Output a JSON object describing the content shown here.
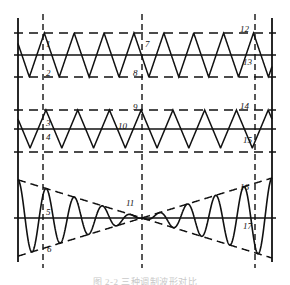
{
  "figure": {
    "caption": "图 2-2  三种调制波形对比",
    "width": 290,
    "height": 285,
    "background": "#ffffff",
    "stroke_color": "#111111"
  },
  "axes": {
    "left_axis_x": 18,
    "right_axis_x": 272,
    "top_y": 18,
    "bottom_y": 262,
    "axis_stroke_width": 1.6
  },
  "markers": {
    "label": "vertical dashed marker lines",
    "dash_pattern": "6,4",
    "stroke_width": 1.4,
    "lines": [
      {
        "name": "marker-line-left",
        "x": 43
      },
      {
        "name": "marker-line-center",
        "x": 142
      },
      {
        "name": "marker-line-right",
        "x": 255
      }
    ]
  },
  "panels": [
    {
      "name": "panel-top-triangle",
      "wave_type": "triangle",
      "center_y": 55,
      "amplitude": 22,
      "upper_guide_y": 33,
      "lower_guide_y": 77,
      "cycles": 8.5,
      "phase": 0.62,
      "guides": [
        {
          "name": "guide-upper-dashed",
          "y": 33,
          "style": "dashed"
        },
        {
          "name": "guide-center-solid",
          "y": 55,
          "style": "solid"
        },
        {
          "name": "guide-lower-dashed",
          "y": 77,
          "style": "dashed"
        }
      ]
    },
    {
      "name": "panel-middle-triangle",
      "wave_type": "triangle",
      "center_y": 129,
      "amplitude": 19,
      "upper_guide_y": 110,
      "lower_guide_y": 152,
      "cycles": 8,
      "phase": 0.62,
      "guides": [
        {
          "name": "guide-upper-dashed",
          "y": 110,
          "style": "dashed"
        },
        {
          "name": "guide-center-solid",
          "y": 129,
          "style": "solid"
        },
        {
          "name": "guide-lower-dashed",
          "y": 152,
          "style": "dashed"
        }
      ]
    },
    {
      "name": "panel-bottom-modulated",
      "wave_type": "amplitude-modulated-sine",
      "center_y": 218,
      "max_amplitude": 40,
      "cycles": 9,
      "envelope_crossing_x": 142,
      "guides": [
        {
          "name": "guide-center-solid",
          "y": 218,
          "style": "solid"
        }
      ],
      "envelope": {
        "name": "envelope-dashed-x-crossing",
        "style": "dashed",
        "description": "two dashed envelopes crossing at the center marker forming an X"
      }
    }
  ],
  "point_labels": [
    {
      "id": "1",
      "name": "point-label-1",
      "text": "1",
      "x": 46,
      "y": 40
    },
    {
      "id": "2",
      "name": "point-label-2",
      "text": "2",
      "x": 46,
      "y": 69
    },
    {
      "id": "3",
      "name": "point-label-3",
      "text": "3",
      "x": 46,
      "y": 119
    },
    {
      "id": "4",
      "name": "point-label-4",
      "text": "4",
      "x": 46,
      "y": 133
    },
    {
      "id": "5",
      "name": "point-label-5",
      "text": "5",
      "x": 46,
      "y": 208
    },
    {
      "id": "6",
      "name": "point-label-6",
      "text": "6",
      "x": 47,
      "y": 245
    },
    {
      "id": "7",
      "name": "point-label-7",
      "text": "7",
      "x": 145,
      "y": 40
    },
    {
      "id": "8",
      "name": "point-label-8",
      "text": "8",
      "x": 133,
      "y": 69
    },
    {
      "id": "9",
      "name": "point-label-9",
      "text": "9",
      "x": 133,
      "y": 103
    },
    {
      "id": "10",
      "name": "point-label-10",
      "text": "10",
      "x": 118,
      "y": 122
    },
    {
      "id": "11",
      "name": "point-label-11",
      "text": "11",
      "x": 126,
      "y": 199
    },
    {
      "id": "12",
      "name": "point-label-12",
      "text": "12",
      "x": 240,
      "y": 25
    },
    {
      "id": "13",
      "name": "point-label-13",
      "text": "13",
      "x": 243,
      "y": 58
    },
    {
      "id": "14",
      "name": "point-label-14",
      "text": "14",
      "x": 240,
      "y": 102
    },
    {
      "id": "15",
      "name": "point-label-15",
      "text": "15",
      "x": 243,
      "y": 136
    },
    {
      "id": "16",
      "name": "point-label-16",
      "text": "16",
      "x": 240,
      "y": 183
    },
    {
      "id": "17",
      "name": "point-label-17",
      "text": "17",
      "x": 243,
      "y": 222
    }
  ],
  "chart_data": {
    "type": "line",
    "xlabel": "",
    "ylabel": "",
    "grid": false,
    "legend": "none",
    "xlim": [
      18,
      272
    ],
    "annotations": [
      "1",
      "2",
      "3",
      "4",
      "5",
      "6",
      "7",
      "8",
      "9",
      "10",
      "11",
      "12",
      "13",
      "14",
      "15",
      "16",
      "17"
    ],
    "vertical_markers_x": [
      43,
      142,
      255
    ],
    "series": [
      {
        "name": "top-triangle-wave",
        "type": "triangle",
        "cycles": 8.5,
        "amplitude": 22,
        "baseline_y": 55,
        "ylim": [
          33,
          77
        ]
      },
      {
        "name": "middle-triangle-wave",
        "type": "triangle",
        "cycles": 8,
        "amplitude": 19,
        "baseline_y": 129,
        "ylim": [
          110,
          152
        ]
      },
      {
        "name": "bottom-am-sine",
        "type": "amplitude-modulated-sine",
        "cycles": 9,
        "amplitude": 40,
        "baseline_y": 218,
        "envelope": "linear taper crossing zero at x=142"
      }
    ]
  }
}
